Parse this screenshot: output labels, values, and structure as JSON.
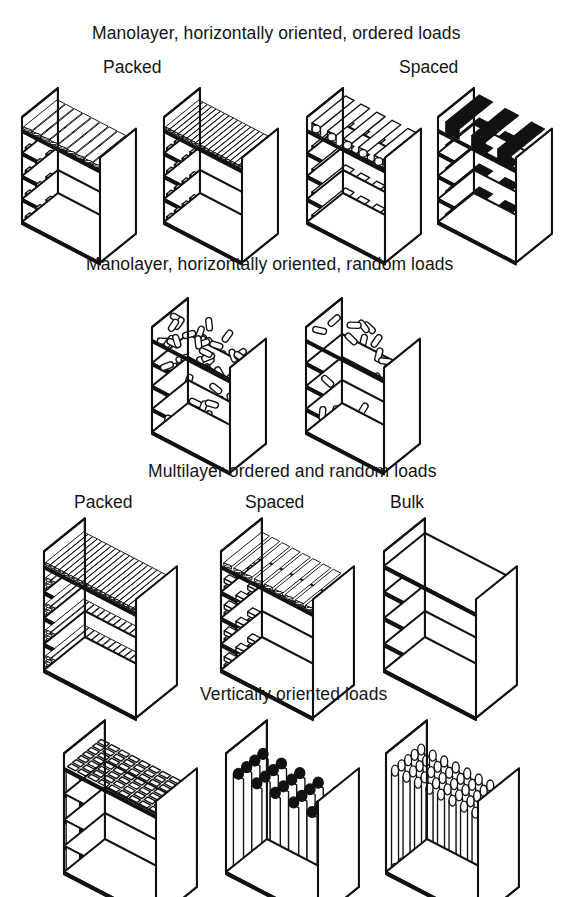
{
  "figure": {
    "title_hidden": "Load configuration diagram",
    "sections": [
      {
        "id": "monolayer-ordered",
        "heading": "Manolayer, horizontally oriented, ordered loads",
        "sub_labels": [
          "Packed",
          "Spaced"
        ],
        "units": [
          {
            "name": "packed-flat-tubes",
            "style": "flat-tubes-light"
          },
          {
            "name": "packed-dense-tubes",
            "style": "dense-tubes-dark"
          },
          {
            "name": "spaced-open-tubes",
            "style": "spaced-tubes-light"
          },
          {
            "name": "spaced-solid-tubes",
            "style": "spaced-tubes-dark"
          }
        ]
      },
      {
        "id": "monolayer-random",
        "heading": "Manolayer, horizontally oriented, random loads",
        "sub_labels": [],
        "units": [
          {
            "name": "random-dense-capsules",
            "style": "random-dense"
          },
          {
            "name": "random-sparse-capsules",
            "style": "random-sparse"
          }
        ]
      },
      {
        "id": "multilayer",
        "heading": "Multilayer ordered and random loads",
        "sub_labels": [
          "Packed",
          "Spaced",
          "Bulk"
        ],
        "units": [
          {
            "name": "multilayer-packed",
            "style": "multi-packed"
          },
          {
            "name": "multilayer-spaced",
            "style": "multi-spaced"
          },
          {
            "name": "multilayer-bulk",
            "style": "multi-bulk"
          }
        ]
      },
      {
        "id": "vertical",
        "heading": "Vertically oriented loads",
        "sub_labels": [],
        "units": [
          {
            "name": "vertical-grid-cells",
            "style": "vert-grid"
          },
          {
            "name": "vertical-round-tubes-spaced",
            "style": "vert-tubes-spaced"
          },
          {
            "name": "vertical-round-tubes-packed",
            "style": "vert-tubes-packed"
          }
        ]
      }
    ],
    "colors": {
      "ink": "#111111",
      "paper": "#ffffff"
    },
    "shelf_levels": 4
  }
}
